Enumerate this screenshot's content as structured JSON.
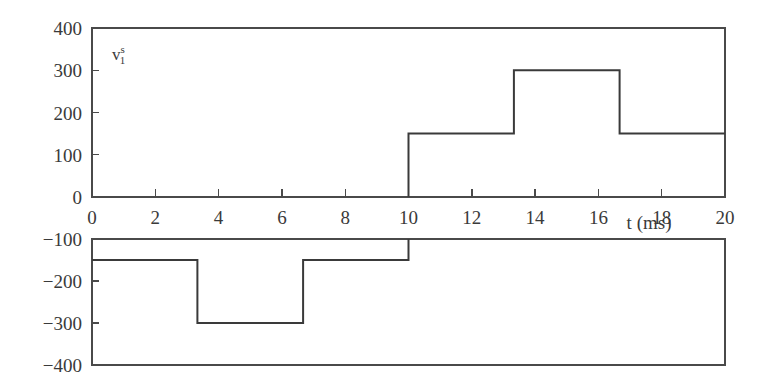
{
  "chart_data": {
    "type": "line",
    "title": "",
    "subtitle": "",
    "xlabel": "t (ms)",
    "ylabel": "",
    "series_label": "v",
    "series_label_sup": "s",
    "series_label_sub": "1",
    "xlim": [
      0,
      20
    ],
    "xticks": [
      0,
      2,
      4,
      6,
      8,
      10,
      12,
      14,
      16,
      18,
      20
    ],
    "xtick_labels": [
      "0",
      "2",
      "4",
      "6",
      "8",
      "10",
      "12",
      "14",
      "16",
      "18",
      "20"
    ],
    "grid": false,
    "legend": "none",
    "panels": [
      {
        "name": "upper-panel",
        "ylim": [
          0,
          400
        ],
        "yticks": [
          0,
          100,
          200,
          300,
          400
        ],
        "ytick_labels": [
          "0",
          "100",
          "200",
          "300",
          "400"
        ]
      },
      {
        "name": "lower-panel",
        "ylim": [
          -400,
          -100
        ],
        "yticks": [
          -100,
          -200,
          -300,
          -400
        ],
        "ytick_labels": [
          "−100",
          "−200",
          "−300",
          "−400"
        ]
      }
    ],
    "x": [
      0,
      3.33,
      3.33,
      6.67,
      6.67,
      10,
      10,
      13.33,
      13.33,
      16.67,
      16.67,
      20
    ],
    "values": [
      -150,
      -150,
      -300,
      -300,
      -150,
      -150,
      150,
      150,
      300,
      300,
      150,
      150
    ],
    "step_segments": [
      {
        "t_start": 0,
        "t_end": 3.33,
        "level": -150
      },
      {
        "t_start": 3.33,
        "t_end": 6.67,
        "level": -300
      },
      {
        "t_start": 6.67,
        "t_end": 10,
        "level": -150
      },
      {
        "t_start": 10,
        "t_end": 13.33,
        "level": 150
      },
      {
        "t_start": 13.33,
        "t_end": 16.67,
        "level": 300
      },
      {
        "t_start": 16.67,
        "t_end": 20,
        "level": 150
      }
    ],
    "line_color": "#3a3a3a",
    "axis_color": "#4a4a4a",
    "background_color": "#ffffff"
  }
}
